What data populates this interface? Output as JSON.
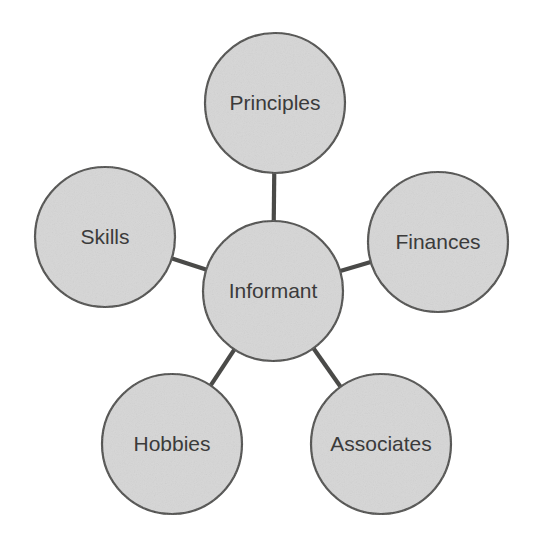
{
  "diagram": {
    "type": "spider-hub-and-spoke",
    "title_visible": false,
    "background_color": "#ffffff",
    "node_fill_color": "#d6d6d6",
    "node_border_color": "#4a4a48",
    "edge_color": "#4a4a48",
    "label_color": "#3b3b3b",
    "center": {
      "id": "informant",
      "label": "Informant",
      "cx": 273,
      "cy": 291,
      "r": 70,
      "font_size": 21
    },
    "spokes": [
      {
        "id": "principles",
        "label": "Principles",
        "cx": 275,
        "cy": 103,
        "r": 70,
        "font_size": 21,
        "position": "top"
      },
      {
        "id": "skills",
        "label": "Skills",
        "cx": 105,
        "cy": 237,
        "r": 70,
        "font_size": 21,
        "position": "left"
      },
      {
        "id": "finances",
        "label": "Finances",
        "cx": 438,
        "cy": 242,
        "r": 70,
        "font_size": 21,
        "position": "right"
      },
      {
        "id": "hobbies",
        "label": "Hobbies",
        "cx": 172,
        "cy": 444,
        "r": 70,
        "font_size": 21,
        "position": "bottom-left"
      },
      {
        "id": "associates",
        "label": "Associates",
        "cx": 381,
        "cy": 444,
        "r": 70,
        "font_size": 21,
        "position": "bottom-right"
      }
    ],
    "edges": [
      {
        "id": "edge-informant-principles",
        "from": "informant",
        "to": "principles"
      },
      {
        "id": "edge-informant-skills",
        "from": "informant",
        "to": "skills"
      },
      {
        "id": "edge-informant-finances",
        "from": "informant",
        "to": "finances"
      },
      {
        "id": "edge-informant-hobbies",
        "from": "informant",
        "to": "hobbies"
      },
      {
        "id": "edge-informant-associates",
        "from": "informant",
        "to": "associates"
      }
    ]
  }
}
